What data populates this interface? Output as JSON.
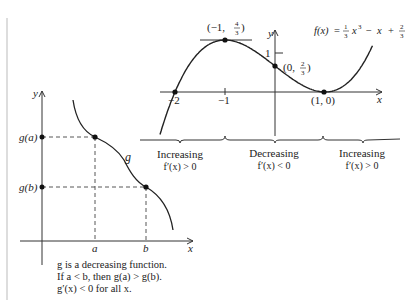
{
  "chart_data": [
    {
      "type": "line",
      "title": "f(x) = 1/3 x^3 − x + 2/3",
      "function": "f(x) = (1/3)x^3 - x + 2/3",
      "xlabel": "x",
      "ylabel": "y",
      "x_ticks": [
        "-2",
        "-1",
        "1"
      ],
      "y_ticks": [
        "1"
      ],
      "xlim": [
        -2.3,
        2.0
      ],
      "ylim": [
        -0.6,
        1.9
      ],
      "grid": false,
      "points": [
        {
          "x": -2,
          "y": 0,
          "label": ""
        },
        {
          "x": -1,
          "y": 1.333,
          "label": "(−1, 4/3)"
        },
        {
          "x": 0,
          "y": 0.667,
          "label": "(0, 2/3)"
        },
        {
          "x": 1,
          "y": 0,
          "label": "(1, 0)"
        }
      ],
      "intervals": [
        {
          "range": "x < -1",
          "label": "Increasing",
          "condition": "f′(x) > 0"
        },
        {
          "range": "-1 < x < 1",
          "label": "Decreasing",
          "condition": "f′(x) < 0"
        },
        {
          "range": "x > 1",
          "label": "Increasing",
          "condition": "f′(x) > 0"
        }
      ]
    },
    {
      "type": "line",
      "title": "g is a decreasing function",
      "xlabel": "x",
      "ylabel": "y",
      "x_ticks": [
        "a",
        "b"
      ],
      "y_ticks": [
        "g(a)",
        "g(b)"
      ],
      "curve_label": "g",
      "grid": false,
      "points": [
        {
          "x": "a",
          "y": "g(a)"
        },
        {
          "x": "b",
          "y": "g(b)"
        }
      ]
    }
  ],
  "right_graph": {
    "formula": {
      "lhs": "f(x)",
      "eq": "=",
      "frac1_num": "1",
      "frac1_den": "3",
      "x3": "x",
      "exp": "3",
      "minus": "−",
      "x": "x",
      "plus": "+",
      "frac2_num": "2",
      "frac2_den": "3"
    },
    "axis_x": "x",
    "axis_y": "y",
    "tick_neg2": "−2",
    "tick_neg1": "−1",
    "tick_y1": "1",
    "max_label": {
      "open": "(−1,",
      "num": "4",
      "den": "3",
      "close": ")"
    },
    "yint_label": {
      "open": "(0,",
      "num": "2",
      "den": "3",
      "close": ")"
    },
    "min_label": "(1, 0)",
    "intervals": [
      {
        "label": "Increasing",
        "condition": "f′(x) > 0"
      },
      {
        "label": "Decreasing",
        "condition": "f′(x) < 0"
      },
      {
        "label": "Increasing",
        "condition": "f′(x) > 0"
      }
    ]
  },
  "left_graph": {
    "axis_x": "x",
    "axis_y": "y",
    "ga": "g(a)",
    "gb": "g(b)",
    "a": "a",
    "b": "b",
    "g": "g",
    "caption": [
      "g is a decreasing function.",
      "If a < b, then g(a) > g(b).",
      "g′(x) < 0 for all x."
    ]
  }
}
